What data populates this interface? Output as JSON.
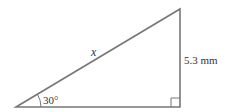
{
  "diagram": {
    "type": "right-triangle",
    "hypotenuse_label": "x",
    "side_label": "5.3 mm",
    "angle_label": "30°",
    "stroke_color": "#777777"
  }
}
